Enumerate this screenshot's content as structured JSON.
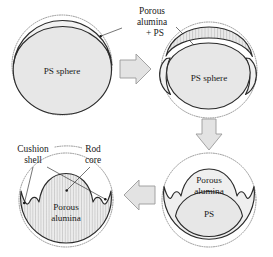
{
  "figure": {
    "background_color": "#ffffff",
    "line_color": "#2b2b2b",
    "fill_light": "#efefef",
    "fill_core": "#e7e7e7",
    "arrow_fill": "#e3e3e3",
    "dotted_stroke": "#8a8a8a"
  },
  "stages": [
    {
      "id": "stage-1",
      "order": 1,
      "inner_label": "PS sphere",
      "description": "PS sphere with thin coating inside dotted outline"
    },
    {
      "id": "stage-2",
      "order": 2,
      "inner_label": "PS sphere",
      "description": "PS sphere with porous alumina + PS shell layer"
    },
    {
      "id": "stage-3",
      "order": 3,
      "inner_label_top": "Porous\nalumina",
      "inner_label_top_line1": "Porous",
      "inner_label_top_line2": "alumina",
      "inner_label_bottom": "PS",
      "description": "Porous alumina dome over remaining PS core"
    },
    {
      "id": "stage-4",
      "order": 4,
      "inner_label_line1": "Porous",
      "inner_label_line2": "alumina",
      "description": "Final rod-core cushion-shell porous alumina structure"
    }
  ],
  "callouts": [
    {
      "id": "callout-porous-alumina-ps",
      "line1": "Porous",
      "line2": "alumina",
      "line3": "+ PS",
      "target_stages": [
        "stage-1",
        "stage-2"
      ]
    },
    {
      "id": "callout-cushion-shell",
      "line1": "Cushion",
      "line2": "shell",
      "target_stage": "stage-4"
    },
    {
      "id": "callout-rod-core",
      "line1": "Rod",
      "line2": "core",
      "target_stage": "stage-4"
    }
  ],
  "arrows": [
    {
      "id": "arrow-1",
      "direction": "right",
      "from": "stage-1",
      "to": "stage-2"
    },
    {
      "id": "arrow-2",
      "direction": "down",
      "from": "stage-2",
      "to": "stage-3"
    },
    {
      "id": "arrow-3",
      "direction": "left",
      "from": "stage-3",
      "to": "stage-4"
    }
  ]
}
